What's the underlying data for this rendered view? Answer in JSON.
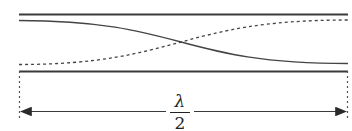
{
  "diagram": {
    "type": "standing-wave-half-wavelength",
    "colors": {
      "stroke": "#3a3a3a",
      "background": "#ffffff"
    },
    "label": {
      "numerator": "λ",
      "denominator": "2"
    },
    "elements": [
      "top-boundary-line",
      "solid-wave-curve",
      "dashed-wave-curve",
      "bottom-boundary-line",
      "left-dashed-marker",
      "right-dashed-marker",
      "double-arrow-dimension"
    ]
  }
}
